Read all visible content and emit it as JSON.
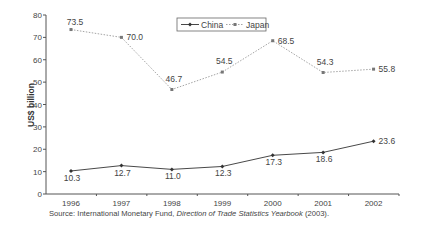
{
  "chart_data": {
    "type": "line",
    "title": "",
    "xlabel": "",
    "ylabel": "US$ billion",
    "categories": [
      "1996",
      "1997",
      "1998",
      "1999",
      "2000",
      "2001",
      "2002"
    ],
    "ylim": [
      0,
      80
    ],
    "yticks": [
      0,
      10,
      20,
      30,
      40,
      50,
      60,
      70,
      80
    ],
    "grid": false,
    "legend_position": "top-center",
    "series": [
      {
        "name": "China",
        "values": [
          10.3,
          12.7,
          11.0,
          12.3,
          17.3,
          18.6,
          23.6
        ],
        "labels": [
          "10.3",
          "12.7",
          "11.0",
          "12.3",
          "17.3",
          "18.6",
          "23.6"
        ],
        "color": "#333333",
        "line_style": "solid",
        "marker": "diamond"
      },
      {
        "name": "Japan",
        "values": [
          73.5,
          70.0,
          46.7,
          54.5,
          68.5,
          54.3,
          55.8
        ],
        "labels": [
          "73.5",
          "70.0",
          "46.7",
          "54.5",
          "68.5",
          "54.3",
          "55.8"
        ],
        "color": "#9a9a9a",
        "line_style": "dotted",
        "marker": "square"
      }
    ]
  },
  "source": {
    "prefix": "Source: International Monetary Fund, ",
    "italic": "Direction of Trade Statistics Yearbook",
    "suffix": " (2003)."
  }
}
